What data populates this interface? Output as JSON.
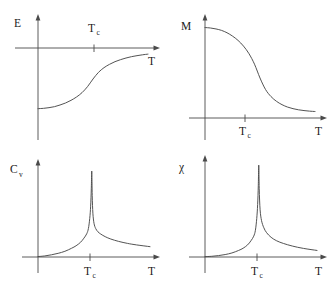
{
  "figure": {
    "background_color": "#ffffff",
    "line_color": "#4a4a4a",
    "text_color": "#1a1a1a"
  },
  "chart_data": [
    {
      "id": "energy",
      "type": "line",
      "title": "",
      "ylabel": "E",
      "ylabel_sub": "",
      "xlabel": "T",
      "annotations": [
        "T",
        "c"
      ],
      "critical_label": "T",
      "critical_sub": "c",
      "critical_label_position": "above-axis",
      "grid": false,
      "legend": "none",
      "xlim": [
        0,
        1
      ],
      "ylim": [
        -1,
        0.08
      ],
      "description": "Internal energy E rises sigmoidally through the critical temperature Tc and saturates toward zero from below.",
      "x": [
        0.0,
        0.05,
        0.1,
        0.15,
        0.2,
        0.25,
        0.3,
        0.35,
        0.4,
        0.45,
        0.5,
        0.55,
        0.6,
        0.65,
        0.7,
        0.75,
        0.8,
        0.85,
        0.9,
        0.95,
        1.0
      ],
      "y": [
        -0.83,
        -0.825,
        -0.815,
        -0.8,
        -0.775,
        -0.745,
        -0.705,
        -0.655,
        -0.59,
        -0.5,
        -0.385,
        -0.285,
        -0.215,
        -0.165,
        -0.125,
        -0.095,
        -0.07,
        -0.05,
        -0.035,
        -0.022,
        -0.012
      ]
    },
    {
      "id": "magnetization",
      "type": "line",
      "title": "",
      "ylabel": "M",
      "ylabel_sub": "",
      "xlabel": "T",
      "annotations": [
        "T",
        "c"
      ],
      "critical_label": "T",
      "critical_sub": "c",
      "critical_label_position": "below-axis",
      "grid": false,
      "legend": "none",
      "xlim": [
        0,
        1
      ],
      "ylim": [
        0,
        1.05
      ],
      "description": "Spontaneous magnetization M falls from its saturation value and vanishes above the critical temperature Tc.",
      "x": [
        0.0,
        0.05,
        0.1,
        0.15,
        0.2,
        0.25,
        0.3,
        0.35,
        0.4,
        0.45,
        0.5,
        0.55,
        0.6,
        0.65,
        0.7,
        0.75,
        0.8,
        0.85,
        0.9,
        0.95,
        1.0
      ],
      "y": [
        0.95,
        0.945,
        0.935,
        0.92,
        0.895,
        0.86,
        0.815,
        0.755,
        0.675,
        0.565,
        0.42,
        0.3,
        0.225,
        0.175,
        0.14,
        0.115,
        0.098,
        0.086,
        0.078,
        0.072,
        0.068
      ]
    },
    {
      "id": "heat-capacity",
      "type": "line",
      "title": "",
      "ylabel": "C",
      "ylabel_sub": "v",
      "xlabel": "T",
      "annotations": [
        "T",
        "c"
      ],
      "critical_label": "T",
      "critical_sub": "c",
      "critical_label_position": "below-axis",
      "grid": false,
      "legend": "none",
      "xlim": [
        0,
        1
      ],
      "ylim": [
        0,
        1.05
      ],
      "description": "Specific heat C_v diverges as a sharp lambda-like peak at the critical temperature Tc.",
      "x": [
        0.0,
        0.06,
        0.12,
        0.18,
        0.24,
        0.3,
        0.34,
        0.38,
        0.41,
        0.435,
        0.45,
        0.462,
        0.47,
        0.476,
        0.48,
        0.484,
        0.49,
        0.5,
        0.515,
        0.535,
        0.56,
        0.6,
        0.65,
        0.72,
        0.8,
        0.88,
        1.0
      ],
      "y": [
        0.005,
        0.012,
        0.025,
        0.042,
        0.065,
        0.1,
        0.128,
        0.168,
        0.215,
        0.265,
        0.325,
        0.44,
        0.58,
        0.78,
        0.98,
        0.7,
        0.5,
        0.385,
        0.325,
        0.288,
        0.262,
        0.232,
        0.205,
        0.178,
        0.155,
        0.138,
        0.118
      ]
    },
    {
      "id": "susceptibility",
      "type": "line",
      "title": "",
      "ylabel": "χ",
      "ylabel_sub": "",
      "xlabel": "T",
      "annotations": [
        "T",
        "c"
      ],
      "critical_label": "T",
      "critical_sub": "c",
      "critical_label_position": "below-axis",
      "grid": false,
      "legend": "none",
      "xlim": [
        0,
        1
      ],
      "ylim": [
        0,
        1.12
      ],
      "description": "Magnetic susceptibility chi diverges sharply at the critical temperature Tc with long power-law tails.",
      "x": [
        0.0,
        0.06,
        0.12,
        0.18,
        0.24,
        0.3,
        0.34,
        0.38,
        0.41,
        0.435,
        0.45,
        0.462,
        0.47,
        0.476,
        0.48,
        0.484,
        0.492,
        0.505,
        0.525,
        0.55,
        0.59,
        0.64,
        0.7,
        0.78,
        0.88,
        1.0
      ],
      "y": [
        0.004,
        0.008,
        0.016,
        0.028,
        0.046,
        0.075,
        0.1,
        0.138,
        0.185,
        0.238,
        0.305,
        0.44,
        0.6,
        0.82,
        1.05,
        0.78,
        0.54,
        0.415,
        0.335,
        0.278,
        0.225,
        0.185,
        0.155,
        0.125,
        0.098,
        0.075
      ]
    }
  ]
}
